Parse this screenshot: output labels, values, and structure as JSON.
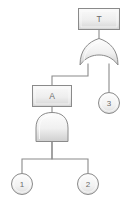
{
  "diagram": {
    "kind": "fault-tree",
    "title": "",
    "colors": {
      "stroke": "#8a8a8a",
      "box_fill_top": "#f7f7f7",
      "box_fill_bottom": "#d9d9d9",
      "gate_fill_top": "#fcfcfc",
      "gate_fill_bottom": "#d6d6d6",
      "circle_fill_top": "#fbfbfb",
      "circle_fill_bottom": "#e2e2e2",
      "text": "#6b6b6b",
      "background": "#ffffff"
    },
    "nodes": [
      {
        "id": "top-event",
        "type": "event-box",
        "label": "T",
        "x": 78,
        "y": 8,
        "width": 42,
        "height": 22
      },
      {
        "id": "or-gate",
        "type": "or-gate",
        "label": "",
        "cx": 99,
        "top": 38,
        "bottom": 66,
        "width": 38
      },
      {
        "id": "intermediate-event-a",
        "type": "event-box",
        "label": "A",
        "x": 32,
        "y": 85,
        "width": 40,
        "height": 22
      },
      {
        "id": "and-gate",
        "type": "and-gate",
        "label": "",
        "cx": 52,
        "top": 112,
        "bottom": 142,
        "width": 32
      },
      {
        "id": "basic-event-3",
        "type": "basic-event-circle",
        "label": "3",
        "cx": 109,
        "cy": 103,
        "r": 11
      },
      {
        "id": "basic-event-1",
        "type": "basic-event-circle",
        "label": "1",
        "cx": 22,
        "cy": 184,
        "r": 11
      },
      {
        "id": "basic-event-2",
        "type": "basic-event-circle",
        "label": "2",
        "cx": 88,
        "cy": 184,
        "r": 11
      }
    ],
    "edges": [
      {
        "id": "edge-top-to-or",
        "from": "top-event",
        "to": "or-gate"
      },
      {
        "id": "edge-or-to-a",
        "from": "or-gate",
        "to": "intermediate-event-a"
      },
      {
        "id": "edge-or-to-3",
        "from": "or-gate",
        "to": "basic-event-3"
      },
      {
        "id": "edge-a-to-and",
        "from": "intermediate-event-a",
        "to": "and-gate"
      },
      {
        "id": "edge-and-to-1",
        "from": "and-gate",
        "to": "basic-event-1"
      },
      {
        "id": "edge-and-to-2",
        "from": "and-gate",
        "to": "basic-event-2"
      }
    ]
  }
}
